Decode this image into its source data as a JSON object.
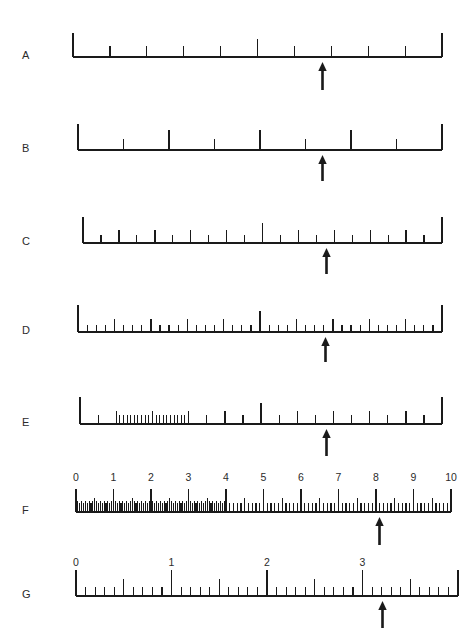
{
  "figure": {
    "background_color": "#ffffff",
    "ink_color": "#1a1a1a",
    "width": 475,
    "height": 628
  },
  "rulers": [
    {
      "letter": "A",
      "letter_x": 22,
      "letter_y": 57,
      "baseline_y": 57,
      "x_start": 73,
      "x_end": 442,
      "end_tick_height": 24,
      "divisions": 10,
      "major_every": 5,
      "major_height": 18,
      "minor_height": 11,
      "arrow_value": 6.5,
      "arrow_x": 322,
      "arrow_top": 62,
      "arrow_height": 28,
      "subticks": []
    },
    {
      "letter": "B",
      "letter_x": 22,
      "letter_y": 150,
      "baseline_y": 150,
      "x_start": 78,
      "x_end": 442,
      "end_tick_height": 26,
      "divisions": 8,
      "major_every": 2,
      "major_height": 20,
      "minor_height": 11,
      "arrow_value": 5.5,
      "arrow_x": 322,
      "arrow_top": 155,
      "arrow_height": 26,
      "subticks": []
    },
    {
      "letter": "C",
      "letter_x": 22,
      "letter_y": 243,
      "baseline_y": 243,
      "x_start": 83,
      "x_end": 442,
      "end_tick_height": 26,
      "divisions": 20,
      "major_every": 10,
      "major_height": 20,
      "mid_every": 2,
      "mid_height": 13,
      "minor_height": 8,
      "arrow_value": 12.5,
      "arrow_x": 326,
      "arrow_top": 248,
      "arrow_height": 26,
      "subticks": []
    },
    {
      "letter": "D",
      "letter_x": 22,
      "letter_y": 332,
      "baseline_y": 332,
      "x_start": 78,
      "x_end": 442,
      "end_tick_height": 27,
      "divisions": 40,
      "major_every": 20,
      "major_height": 21,
      "mid_every": 4,
      "mid_height": 13,
      "minor_height": 7,
      "arrow_value": 25.5,
      "arrow_x": 325,
      "arrow_top": 337,
      "arrow_height": 25,
      "subticks": []
    },
    {
      "letter": "E",
      "letter_x": 22,
      "letter_y": 424,
      "baseline_y": 424,
      "x_start": 80,
      "x_end": 442,
      "end_tick_height": 27,
      "divisions": 20,
      "major_every": 10,
      "major_height": 21,
      "mid_every": 2,
      "mid_height": 13,
      "minor_height": 9,
      "arrow_value": 13,
      "arrow_x": 326,
      "arrow_top": 429,
      "arrow_height": 27,
      "subticks": {
        "from_division": 2,
        "to_division": 6,
        "per_division": 5,
        "height": 9
      }
    },
    {
      "letter": "F",
      "letter_x": 22,
      "letter_y": 512,
      "baseline_y": 512,
      "x_start": 76,
      "x_end": 451,
      "end_tick_height": 23,
      "divisions": 10,
      "major_every": 1,
      "major_height": 23,
      "mid_every": 0.5,
      "mid_height": 14,
      "minor_per_division": 10,
      "minor_height": 9,
      "dense_from": 0,
      "dense_to": 4,
      "dense_per_division": 20,
      "dense_height": 11,
      "arrow_value": 8.0,
      "arrow_x": 379,
      "arrow_top": 517,
      "arrow_height": 28,
      "labels": [
        "0",
        "1",
        "2",
        "3",
        "4",
        "5",
        "6",
        "7",
        "8",
        "9",
        "10"
      ],
      "label_y": 471
    },
    {
      "letter": "G",
      "letter_x": 22,
      "letter_y": 596,
      "baseline_y": 596,
      "x_start": 76,
      "x_end": 458,
      "end_tick_height": 26,
      "divisions": 4,
      "major_every": 1,
      "major_height": 26,
      "mid_every": 0.5,
      "mid_height": 17,
      "minor_per_division": 10,
      "minor_height": 9,
      "arrow_value": 3.2,
      "arrow_x": 382,
      "arrow_top": 601,
      "arrow_height": 27,
      "labels": [
        "0",
        "1",
        "2",
        "3"
      ],
      "label_y": 556
    }
  ],
  "chart_data": {
    "type": "table",
    "categories": [
      "A",
      "B",
      "C",
      "D",
      "E",
      "F",
      "G"
    ],
    "series": [
      {
        "name": "divisions",
        "values": [
          10,
          8,
          20,
          40,
          20,
          10,
          4
        ]
      },
      {
        "name": "arrow_position",
        "values": [
          6.5,
          5.5,
          12.5,
          25.5,
          13,
          8.0,
          3.2
        ]
      }
    ],
    "xlabel": "",
    "ylabel": "",
    "grid": false,
    "legend": "none"
  }
}
